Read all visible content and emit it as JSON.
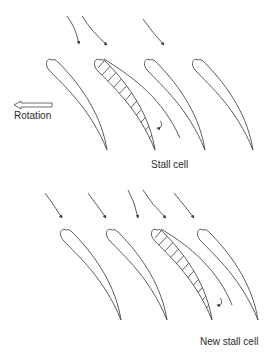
{
  "figure": {
    "top_panel": {
      "label": "Stall cell",
      "rotation_label": "Rotation",
      "blade_count": 4,
      "stalled_blade_index": 2,
      "inflow_arrow_count": 3
    },
    "bottom_panel": {
      "label": "New stall cell",
      "blade_count": 4,
      "stalled_blade_index": 3,
      "inflow_arrow_count": 5
    },
    "icons": {
      "rotation_arrow": "left-hollow-arrow-icon",
      "recirculation": "curled-arrow-icon"
    },
    "colors": {
      "line": "#4a4a4a",
      "text": "#2a2a2a",
      "background": "#ffffff"
    }
  }
}
